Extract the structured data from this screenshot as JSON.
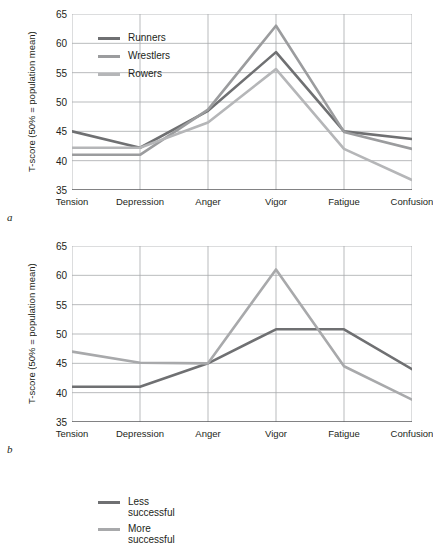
{
  "figure": {
    "panels": [
      {
        "letter": "a",
        "ylabel": "T-score (50% = population mean)",
        "legend": [
          {
            "label": "Runners",
            "color": "#6f7072"
          },
          {
            "label": "Wrestlers",
            "color": "#9b9c9e"
          },
          {
            "label": "Rowers",
            "color": "#b5b6b8"
          }
        ]
      },
      {
        "letter": "b",
        "ylabel": "T-score (50% = population mean)",
        "legend": [
          {
            "label": "Less\nsuccessful",
            "color": "#6f7072"
          },
          {
            "label": "More\nsuccessful",
            "color": "#a8a9ab"
          }
        ]
      }
    ]
  },
  "chart_data": [
    {
      "type": "line",
      "title": "",
      "panel": "a",
      "xlabel": "",
      "ylabel": "T-score (50% = population mean)",
      "categories": [
        "Tension",
        "Depression",
        "Anger",
        "Vigor",
        "Fatigue",
        "Confusion"
      ],
      "yticks": [
        35,
        40,
        45,
        50,
        55,
        60,
        65
      ],
      "ylim": [
        35,
        65
      ],
      "grid": true,
      "legend_position": "upper-left",
      "series": [
        {
          "name": "Runners",
          "color": "#6f7072",
          "values": [
            45.0,
            42.2,
            48.5,
            58.5,
            45.0,
            43.7
          ]
        },
        {
          "name": "Wrestlers",
          "color": "#9b9c9e",
          "values": [
            41.0,
            41.0,
            48.7,
            63.0,
            44.9,
            42.0
          ]
        },
        {
          "name": "Rowers",
          "color": "#b5b6b8",
          "values": [
            42.2,
            42.2,
            46.5,
            55.6,
            42.0,
            36.7
          ]
        }
      ]
    },
    {
      "type": "line",
      "title": "",
      "panel": "b",
      "xlabel": "",
      "ylabel": "T-score (50% = population mean)",
      "categories": [
        "Tension",
        "Depression",
        "Anger",
        "Vigor",
        "Fatigue",
        "Confusion"
      ],
      "yticks": [
        35,
        40,
        45,
        50,
        55,
        60,
        65
      ],
      "ylim": [
        35,
        65
      ],
      "grid": true,
      "legend_position": "upper-left",
      "series": [
        {
          "name": "Less successful",
          "color": "#6f7072",
          "values": [
            41.0,
            41.0,
            45.0,
            50.8,
            50.8,
            44.0
          ]
        },
        {
          "name": "More successful",
          "color": "#a8a9ab",
          "values": [
            47.0,
            45.1,
            45.0,
            61.0,
            44.5,
            38.8
          ]
        }
      ]
    }
  ],
  "style": {
    "axis_color": "#58595b",
    "grid_color": "#a7a9ac",
    "text_color": "#231f20"
  }
}
